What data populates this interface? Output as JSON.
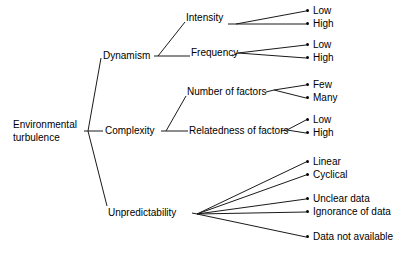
{
  "diagram": {
    "title": "",
    "type": "hierarchical-tree",
    "orientation": "left-to-right",
    "colors": {
      "line": "#1a1a1a",
      "text": "#000000",
      "background": "#ffffff",
      "marker": "#000000"
    },
    "root": {
      "label_line1": "Environmental",
      "label_line2": "turbulence",
      "label": "Environmental turbulence"
    },
    "level1": [
      {
        "label": "Dynamism"
      },
      {
        "label": "Complexity"
      },
      {
        "label": "Unpredictability"
      }
    ],
    "level2": [
      {
        "label": "Intensity",
        "parent": "Dynamism"
      },
      {
        "label": "Frequency",
        "parent": "Dynamism"
      },
      {
        "label": "Number of factors",
        "parent": "Complexity"
      },
      {
        "label": "Relatedness of factors",
        "parent": "Complexity"
      }
    ],
    "leaves": [
      {
        "label": "Low",
        "parent": "Intensity"
      },
      {
        "label": "High",
        "parent": "Intensity"
      },
      {
        "label": "Low",
        "parent": "Frequency"
      },
      {
        "label": "High",
        "parent": "Frequency"
      },
      {
        "label": "Few",
        "parent": "Number of factors"
      },
      {
        "label": "Many",
        "parent": "Number of factors"
      },
      {
        "label": "Low",
        "parent": "Relatedness of factors"
      },
      {
        "label": "High",
        "parent": "Relatedness of factors"
      },
      {
        "label": "Linear",
        "parent": "Unpredictability"
      },
      {
        "label": "Cyclical",
        "parent": "Unpredictability"
      },
      {
        "label": "Unclear data",
        "parent": "Unpredictability"
      },
      {
        "label": "Ignorance of data",
        "parent": "Unpredictability"
      },
      {
        "label": "Data not available",
        "parent": "Unpredictability"
      }
    ]
  }
}
